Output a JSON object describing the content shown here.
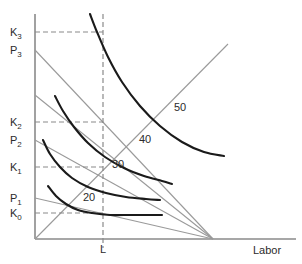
{
  "figure": {
    "type": "isoquant-isocost-diagram",
    "background_color": "#ffffff",
    "axis_color": "#8a8a8a",
    "isoquant_color": "#1a1a1a",
    "isocost_color": "#9a9a9a",
    "dashed_color": "#8a8a8a",
    "text_color": "#2b2b2b"
  },
  "axes": {
    "x_axis_title": "Labor",
    "y_axis_title": "",
    "origin": {
      "x": 35,
      "y": 239
    },
    "x_axis_end": {
      "x": 296,
      "y": 239
    },
    "y_axis_top": {
      "x": 35,
      "y": 14
    }
  },
  "y_axis_labels": [
    {
      "text": "K",
      "sub": "3",
      "x": 10,
      "y": 27,
      "value_y": 32
    },
    {
      "text": "P",
      "sub": "3",
      "x": 10,
      "y": 45,
      "value_y": 50
    },
    {
      "text": "K",
      "sub": "2",
      "x": 10,
      "y": 117,
      "value_y": 122
    },
    {
      "text": "P",
      "sub": "2",
      "x": 10,
      "y": 135,
      "value_y": 140
    },
    {
      "text": "K",
      "sub": "1",
      "x": 10,
      "y": 162,
      "value_y": 167
    },
    {
      "text": "P",
      "sub": "1",
      "x": 10,
      "y": 193,
      "value_y": 198
    },
    {
      "text": "K",
      "sub": "0",
      "x": 10,
      "y": 208,
      "value_y": 213
    }
  ],
  "x_axis_ticks": [
    {
      "label": "L",
      "x": 100,
      "y": 244,
      "value_x": 103
    }
  ],
  "isoquant_labels": [
    {
      "label": "20",
      "x": 83,
      "y": 192
    },
    {
      "label": "30",
      "x": 112,
      "y": 159
    },
    {
      "label": "40",
      "x": 139,
      "y": 134
    },
    {
      "label": "50",
      "x": 174,
      "y": 102
    }
  ],
  "axis_titles": {
    "labor": {
      "text": "Labor",
      "x": 253,
      "y": 245
    }
  },
  "chart_data": {
    "type": "line",
    "title": "",
    "xlabel": "Labor",
    "ylabel": "",
    "grid": false,
    "legend": "none",
    "isoquants": [
      {
        "name": "20",
        "label": "20",
        "points": [
          [
            48,
            186
          ],
          [
            56,
            196
          ],
          [
            66,
            204
          ],
          [
            78,
            210
          ],
          [
            92,
            213
          ],
          [
            110,
            215
          ],
          [
            130,
            215
          ],
          [
            150,
            215
          ],
          [
            162,
            215
          ]
        ]
      },
      {
        "name": "30",
        "label": "30",
        "points": [
          [
            43,
            140
          ],
          [
            50,
            154
          ],
          [
            60,
            167
          ],
          [
            72,
            178
          ],
          [
            88,
            187
          ],
          [
            106,
            193
          ],
          [
            126,
            197
          ],
          [
            146,
            199
          ],
          [
            160,
            200
          ]
        ]
      },
      {
        "name": "40",
        "label": "40",
        "points": [
          [
            55,
            96
          ],
          [
            63,
            111
          ],
          [
            74,
            127
          ],
          [
            88,
            143
          ],
          [
            105,
            157
          ],
          [
            124,
            168
          ],
          [
            144,
            176
          ],
          [
            162,
            181
          ],
          [
            172,
            184
          ]
        ]
      },
      {
        "name": "50",
        "label": "50",
        "points": [
          [
            90,
            14
          ],
          [
            97,
            32
          ],
          [
            108,
            57
          ],
          [
            122,
            82
          ],
          [
            140,
            106
          ],
          [
            160,
            126
          ],
          [
            182,
            142
          ],
          [
            204,
            152
          ],
          [
            224,
            156
          ]
        ]
      }
    ],
    "isocost_lines": [
      {
        "name": "isocost-p3",
        "from": [
          35,
          50
        ],
        "to": [
          213,
          239
        ]
      },
      {
        "name": "isocost-p2",
        "from": [
          35,
          140
        ],
        "to": [
          213,
          239
        ]
      },
      {
        "name": "isocost-p1",
        "from": [
          35,
          198
        ],
        "to": [
          213,
          239
        ]
      },
      {
        "name": "isocost-mid",
        "from": [
          35,
          95
        ],
        "to": [
          213,
          239
        ]
      }
    ],
    "expansion_path": {
      "name": "expansion-path",
      "from": [
        35,
        239
      ],
      "to": [
        228,
        44
      ]
    },
    "short_run_path": {
      "name": "short-run-vertical-line",
      "from": [
        103,
        14
      ],
      "to": [
        103,
        248
      ]
    },
    "dashed_guides": [
      {
        "name": "guide-k3",
        "from": [
          35,
          32
        ],
        "to": [
          103,
          32
        ]
      },
      {
        "name": "guide-k2",
        "from": [
          35,
          122
        ],
        "to": [
          103,
          122
        ]
      },
      {
        "name": "guide-k1",
        "from": [
          35,
          167
        ],
        "to": [
          103,
          167
        ]
      },
      {
        "name": "guide-k0",
        "from": [
          35,
          213
        ],
        "to": [
          103,
          213
        ]
      }
    ],
    "convergence_point": [
      213,
      239
    ]
  }
}
